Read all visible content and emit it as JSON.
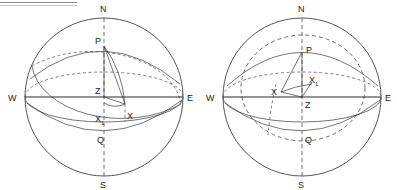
{
  "figure": {
    "ink_color": "#2b2b2b",
    "background_color": "#ffffff",
    "dashed_color": "#4a4a4a"
  },
  "diagrams": [
    {
      "id": "left-diagram",
      "name": "celestial-sphere-left",
      "caption": "",
      "labels": {
        "north": "N",
        "south": "S",
        "west": "W",
        "east": "E",
        "pole": "P",
        "zenith": "Z",
        "equator_point": "Q",
        "star": "X",
        "star_sub": "X",
        "star_sub_index": "1"
      }
    },
    {
      "id": "right-diagram",
      "name": "celestial-sphere-right",
      "caption": "",
      "labels": {
        "north": "N",
        "south": "S",
        "west": "W",
        "east": "E",
        "pole": "P",
        "zenith": "Z",
        "equator_point": "Q",
        "star": "X",
        "star_sub": "X",
        "star_sub_index": "1"
      }
    }
  ]
}
